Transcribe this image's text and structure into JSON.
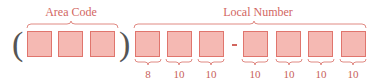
{
  "diagram": {
    "area_code": {
      "label": "Area Code",
      "open_paren": "(",
      "close_paren": ")",
      "digit_boxes": 3
    },
    "local_number": {
      "label": "Local Number",
      "separator": "-",
      "digit_boxes": 7,
      "choices_per_digit": [
        "8",
        "10",
        "10",
        "10",
        "10",
        "10",
        "10"
      ]
    },
    "colors": {
      "box_fill": "#f5b9b3",
      "box_border": "#e0756d",
      "label_text": "#d2665f",
      "brace": "#e08a83",
      "paren": "#555555"
    }
  }
}
